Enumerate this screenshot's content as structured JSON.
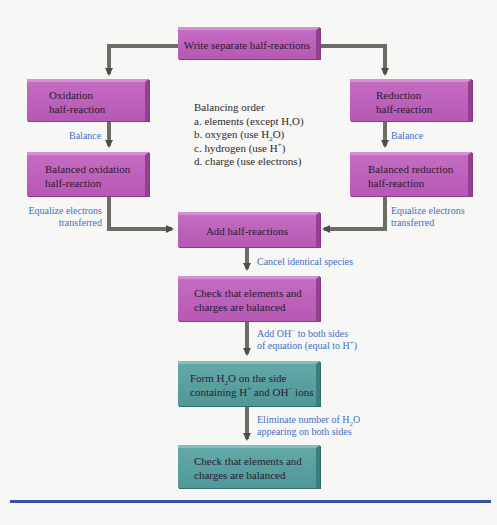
{
  "diagram": {
    "colors": {
      "process_box_magenta": "#bd62bb",
      "process_box_teal": "#57a09f",
      "arrow": "#5a5e55",
      "label_blue": "#3f6fc4",
      "rule_blue": "#3a4fa8"
    },
    "boxes": {
      "write": {
        "lines": [
          "Write separate half-reactions"
        ]
      },
      "oxidation": {
        "lines": [
          "Oxidation",
          "half-reaction"
        ]
      },
      "reduction": {
        "lines": [
          "Reduction",
          "half-reaction"
        ]
      },
      "balanced_oxidation": {
        "lines": [
          "Balanced oxidation",
          "half-reaction"
        ]
      },
      "balanced_reduction": {
        "lines": [
          "Balanced reduction",
          "half-reaction"
        ]
      },
      "add": {
        "lines": [
          "Add half-reactions"
        ]
      },
      "check1": {
        "lines": [
          "Check that elements and",
          "charges are balanced"
        ]
      },
      "form_water": {
        "line1": [
          "Form H",
          "2",
          "O on the side"
        ],
        "line2": [
          "containing H",
          "+",
          " and OH",
          "−",
          " ions"
        ]
      },
      "check2": {
        "lines": [
          "Check that elements and",
          "charges are balanced"
        ]
      }
    },
    "labels": {
      "balance_left": "Balance",
      "balance_right": "Balance",
      "equalize_left": [
        "Equalize electrons",
        "transferred"
      ],
      "equalize_right": [
        "Equalize electrons",
        "transferred"
      ],
      "cancel": "Cancel identical species",
      "add_oh": {
        "line1": [
          "Add OH",
          "−",
          " to both sides"
        ],
        "line2": [
          "of equation (equal to H",
          "+",
          ")"
        ]
      },
      "eliminate": {
        "line1": [
          "Eliminate number of H",
          "2",
          "O"
        ],
        "line2": "appearing on both sides"
      }
    },
    "balancing_order": {
      "heading": "Balancing order",
      "a": [
        "a. elements (except H,O)"
      ],
      "b": [
        "b. oxygen (use H",
        "2",
        "O)"
      ],
      "c": [
        "c. hydrogen (use H",
        "+",
        ")"
      ],
      "d": [
        "d. charge (use electrons)"
      ]
    }
  }
}
